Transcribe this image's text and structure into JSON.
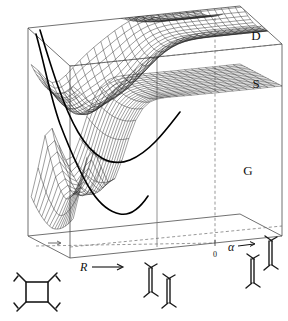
{
  "figure": {
    "kind": "3d-potential-energy-surface-plot",
    "background_color": "#ffffff",
    "line_color": "#1a1a1a",
    "mesh_color": "#333333",
    "dashed_color": "#555555"
  },
  "state_labels": [
    {
      "text": "D",
      "name": "surface-label-d",
      "x": 256,
      "y": 40
    },
    {
      "text": "S",
      "name": "surface-label-s",
      "x": 256,
      "y": 88
    },
    {
      "text": "G",
      "name": "surface-label-g",
      "x": 248,
      "y": 175
    }
  ],
  "axes": {
    "r_axis": {
      "label": "R",
      "arrow": "→",
      "x": 86,
      "y": 268
    },
    "alpha_axis": {
      "label": "α",
      "arrow": "→",
      "x": 232,
      "y": 251
    },
    "alpha_zero_tick": {
      "label": "0",
      "x": 215,
      "y": 256
    }
  },
  "molecules": [
    {
      "name": "molecule-square-cyclobutadiene",
      "type": "square",
      "x": 40,
      "y": 290
    },
    {
      "name": "molecule-twisted-ethylene-1",
      "type": "twisted-ethylene",
      "x": 152,
      "y": 277
    },
    {
      "name": "molecule-twisted-ethylene-2",
      "type": "twisted-ethylene",
      "x": 169,
      "y": 288
    },
    {
      "name": "molecule-twisted-ethylene-3",
      "type": "twisted-ethylene",
      "x": 253,
      "y": 268
    },
    {
      "name": "molecule-twisted-ethylene-4",
      "type": "twisted-ethylene",
      "x": 271,
      "y": 250
    }
  ],
  "chart_data": {
    "type": "surface",
    "title": "",
    "xlabel": "R",
    "ylabel": "α",
    "zlabel": "",
    "grid": false,
    "legend_position": "right-inline",
    "axis_ticks": {
      "alpha": [
        "0"
      ]
    },
    "series": [
      {
        "name": "D",
        "description": "upper doubly-excited state surface, nearly flat sheet in upper region"
      },
      {
        "name": "S",
        "description": "singly-excited state surface, sheet below D with conical intersection toward G"
      },
      {
        "name": "G",
        "description": "ground state surface with deep double-well at small R and flat plateau at large R"
      }
    ]
  }
}
